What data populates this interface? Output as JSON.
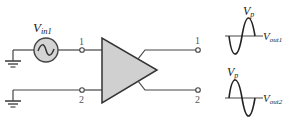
{
  "diagram": {
    "type": "differential-amplifier-circuit",
    "source": {
      "label_main": "V",
      "label_sub": "in1",
      "symbol": "ac-sine-source"
    },
    "inputs": [
      {
        "label": "1"
      },
      {
        "label": "2"
      }
    ],
    "amplifier": {
      "symbol": "triangle-amplifier"
    },
    "outputs": [
      {
        "label": "1"
      },
      {
        "label": "2"
      }
    ],
    "waveforms": [
      {
        "peak_label_main": "V",
        "peak_label_sub": "p",
        "out_label_main": "V",
        "out_label_sub": "out1",
        "phase": "inverted"
      },
      {
        "peak_label_main": "V",
        "peak_label_sub": "p",
        "out_label_main": "V",
        "out_label_sub": "out2",
        "phase": "in-phase"
      }
    ],
    "colors": {
      "line": "#444444",
      "source_fill": "#d4d4d4",
      "amplifier_fill": "#d0d0d0",
      "background": "#ffffff"
    }
  }
}
